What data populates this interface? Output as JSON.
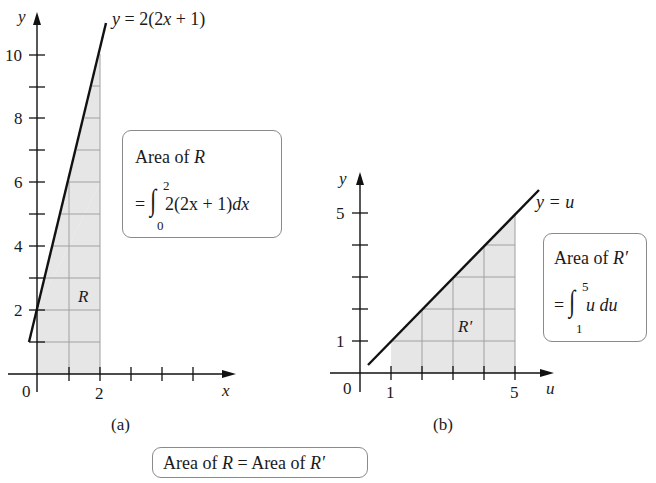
{
  "colors": {
    "shade": "#e6e6e6",
    "grid": "#9a9a9a",
    "line": "#111111",
    "box_border": "#8a8a8a"
  },
  "panel_a": {
    "caption": "(a)",
    "curve_label_y": "y",
    "curve_label_eq": "= 2(2",
    "curve_label_x": "x",
    "curve_label_end": "+ 1)",
    "axis_x_label": "x",
    "axis_y_label": "y",
    "origin_label": "0",
    "x_tick_labels": [
      "2"
    ],
    "y_tick_labels": [
      "10",
      "8",
      "6",
      "4",
      "2"
    ],
    "region_label": "R",
    "box": {
      "title_text": "Area of ",
      "title_var": "R",
      "eq_sign": "=",
      "upper_limit": "2",
      "lower_limit": "0",
      "integrand": "2(2x + 1)",
      "differential": "dx"
    }
  },
  "panel_b": {
    "caption": "(b)",
    "curve_label": "y = u",
    "axis_x_label": "u",
    "axis_y_label": "y",
    "origin_label": "0",
    "x_tick_labels": [
      "1",
      "5"
    ],
    "y_tick_labels": [
      "5",
      "1"
    ],
    "region_label": "R′",
    "box": {
      "title_text": "Area of ",
      "title_var": "R′",
      "eq_sign": "=",
      "upper_limit": "5",
      "lower_limit": "1",
      "integrand": "u du"
    }
  },
  "footer": {
    "text1": "Area of ",
    "var1": "R",
    "text2": " = Area of ",
    "var2": "R′"
  }
}
